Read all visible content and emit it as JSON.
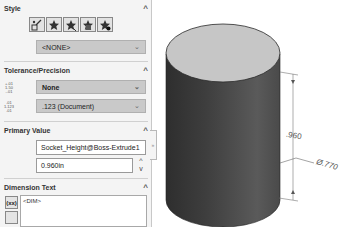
{
  "property_manager": {
    "style": {
      "title": "Style",
      "collapse": "^",
      "icons": [
        "apply-default-style-icon",
        "add-style-icon",
        "delete-style-icon",
        "save-style-icon",
        "load-style-icon"
      ],
      "select_value": "<NONE>"
    },
    "tolerance": {
      "title": "Tolerance/Precision",
      "collapse": "^",
      "tolerance_icon_text": "1.50",
      "tolerance_value": "None",
      "precision_icon_text": "1.123",
      "precision_value": ".123 (Document)"
    },
    "primary_value": {
      "title": "Primary Value",
      "collapse": "^",
      "name_value": "Socket_Height@Boss-Extrude1",
      "numeric_value": "0.960in",
      "spin_up": "^",
      "spin_down": "v"
    },
    "dimension_text": {
      "title": "Dimension Text",
      "collapse": "^",
      "dim_button_label": "(xx)",
      "text_value": "<DIM>"
    },
    "side_tab_glyph": "»"
  },
  "viewport": {
    "height_dimension": ".960",
    "diameter_dimension": "Ø.770"
  },
  "colors": {
    "panel_bg": "#f4f4f4",
    "select_bg": "#c9c9c9",
    "cylinder_top": "#c6c6c6",
    "cylinder_side_dark": "#3a3a3a",
    "cylinder_side_mid": "#555555"
  }
}
